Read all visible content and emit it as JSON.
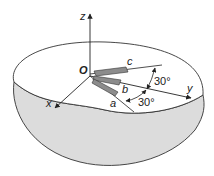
{
  "diagram": {
    "axes": {
      "z": "z",
      "y": "y",
      "x": "x",
      "origin": "O"
    },
    "directions": {
      "a": "a",
      "b": "b",
      "c": "c"
    },
    "angles": {
      "upper": "30°",
      "lower": "30°"
    },
    "colors": {
      "bowl_fill": "#dcdcdc",
      "outline": "#333333",
      "blade_fill": "#8c8c8c"
    }
  }
}
